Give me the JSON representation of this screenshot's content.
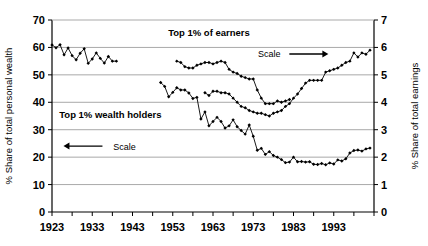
{
  "chart_data": {
    "type": "line",
    "title": "",
    "subtitle": "",
    "xlabel": "",
    "ylabel": "% Share of total personal wealth",
    "y2label": "% Share of total earnings",
    "xlim": [
      1923,
      2003
    ],
    "ylim": [
      0,
      70
    ],
    "y2lim": [
      0,
      7
    ],
    "xticks": [
      1923,
      1933,
      1943,
      1953,
      1963,
      1973,
      1983,
      1993
    ],
    "xtick_labels": [
      "1923",
      "1933",
      "1943",
      "1953",
      "1963",
      "1973",
      "1983",
      "1993"
    ],
    "xminor_step": 5,
    "yticks": [
      0,
      10,
      20,
      30,
      40,
      50,
      60,
      70
    ],
    "ytick_labels": [
      "0",
      "10",
      "20",
      "30",
      "40",
      "50",
      "60",
      "70"
    ],
    "y2ticks": [
      0,
      1,
      2,
      3,
      4,
      5,
      6,
      7
    ],
    "y2tick_labels": [
      "0",
      "1",
      "2",
      "3",
      "4",
      "5",
      "6",
      "7"
    ],
    "grid": "horizontal",
    "legend_position": "inline-annotations",
    "annotations": [
      {
        "name": "earners-label",
        "text": "Top 1% of earners",
        "x": 1962.0,
        "y_frac": 0.915
      },
      {
        "name": "earners-scale",
        "text": "Scale",
        "x": 1977.0,
        "y_frac": 0.805,
        "arrow": "right"
      },
      {
        "name": "wealth-label",
        "text": "Top 1% wealth holders",
        "x": 1937.5,
        "y_frac": 0.49
      },
      {
        "name": "wealth-scale",
        "text": "Scale",
        "x": 1941.0,
        "y_frac": 0.325,
        "arrow": "left"
      }
    ],
    "series": [
      {
        "name": "Top 1% wealth holders",
        "axis": "left",
        "marker": "diamond",
        "color": "#000000",
        "points": [
          [
            1923,
            60.9
          ],
          [
            1924,
            59.9
          ],
          [
            1925,
            61.0
          ],
          [
            1926,
            57.3
          ],
          [
            1927,
            59.8
          ],
          [
            1928,
            57.0
          ],
          [
            1929,
            55.5
          ],
          [
            1930,
            57.9
          ],
          [
            1931,
            59.5
          ],
          [
            1932,
            54.2
          ],
          [
            1933,
            55.8
          ],
          [
            1934,
            58.0
          ],
          [
            1935,
            56.0
          ],
          [
            1936,
            54.3
          ],
          [
            1937,
            56.7
          ],
          [
            1938,
            55.0
          ],
          [
            1939,
            55.0
          ],
          [
            1950,
            47.2
          ],
          [
            1951,
            45.8
          ],
          [
            1952,
            42.0
          ],
          [
            1953,
            43.6
          ],
          [
            1954,
            45.3
          ],
          [
            1955,
            44.5
          ],
          [
            1956,
            44.5
          ],
          [
            1957,
            43.4
          ],
          [
            1958,
            41.4
          ],
          [
            1959,
            41.8
          ],
          [
            1960,
            33.9
          ],
          [
            1961,
            36.5
          ],
          [
            1962,
            31.4
          ],
          [
            1963,
            33.0
          ],
          [
            1964,
            34.5
          ],
          [
            1965,
            33.0
          ],
          [
            1966,
            30.6
          ],
          [
            1967,
            31.4
          ],
          [
            1968,
            33.6
          ],
          [
            1969,
            31.1
          ],
          [
            1970,
            29.7
          ],
          [
            1971,
            28.4
          ],
          [
            1972,
            31.7
          ],
          [
            1973,
            27.6
          ],
          [
            1974,
            22.5
          ],
          [
            1975,
            23.2
          ],
          [
            1976,
            21.0
          ],
          [
            1977,
            22.0
          ],
          [
            1978,
            20.6
          ],
          [
            1979,
            20.0
          ],
          [
            1980,
            19.1
          ],
          [
            1981,
            18.0
          ],
          [
            1982,
            18.2
          ],
          [
            1983,
            20.0
          ],
          [
            1984,
            18.3
          ],
          [
            1985,
            18.4
          ],
          [
            1986,
            18.2
          ],
          [
            1987,
            18.3
          ],
          [
            1988,
            17.4
          ],
          [
            1989,
            17.3
          ],
          [
            1990,
            17.7
          ],
          [
            1991,
            17.2
          ],
          [
            1992,
            17.9
          ],
          [
            1993,
            17.5
          ],
          [
            1994,
            19.0
          ],
          [
            1995,
            18.6
          ],
          [
            1996,
            19.4
          ],
          [
            1997,
            21.5
          ],
          [
            1998,
            22.4
          ],
          [
            1999,
            22.6
          ],
          [
            2000,
            22.2
          ],
          [
            2001,
            23.0
          ],
          [
            2002,
            23.3
          ]
        ]
      },
      {
        "name": "Top 1% of earners",
        "axis": "right",
        "marker": "diamond",
        "color": "#000000",
        "points": [
          [
            1954,
            5.5
          ],
          [
            1955,
            5.45
          ],
          [
            1956,
            5.3
          ],
          [
            1957,
            5.25
          ],
          [
            1958,
            5.25
          ],
          [
            1959,
            5.35
          ],
          [
            1960,
            5.4
          ],
          [
            1961,
            5.45
          ],
          [
            1962,
            5.45
          ],
          [
            1963,
            5.4
          ],
          [
            1964,
            5.45
          ],
          [
            1965,
            5.5
          ],
          [
            1966,
            5.45
          ],
          [
            1967,
            5.2
          ],
          [
            1968,
            5.1
          ],
          [
            1969,
            5.05
          ],
          [
            1970,
            4.95
          ],
          [
            1971,
            4.9
          ],
          [
            1972,
            4.85
          ],
          [
            1973,
            4.85
          ],
          [
            1974,
            4.45
          ],
          [
            1975,
            4.15
          ],
          [
            1976,
            3.95
          ],
          [
            1977,
            3.95
          ],
          [
            1978,
            3.95
          ],
          [
            1979,
            4.05
          ],
          [
            1980,
            4.0
          ],
          [
            1981,
            4.05
          ],
          [
            1982,
            4.1
          ],
          [
            1961,
            4.35
          ],
          [
            1962,
            4.25
          ],
          [
            1963,
            4.4
          ],
          [
            1964,
            4.4
          ],
          [
            1965,
            4.35
          ],
          [
            1966,
            4.35
          ],
          [
            1967,
            4.3
          ],
          [
            1968,
            4.15
          ],
          [
            1969,
            4.0
          ],
          [
            1970,
            3.85
          ],
          [
            1971,
            3.8
          ],
          [
            1972,
            3.7
          ],
          [
            1973,
            3.65
          ],
          [
            1974,
            3.6
          ],
          [
            1975,
            3.6
          ],
          [
            1976,
            3.55
          ],
          [
            1977,
            3.5
          ],
          [
            1978,
            3.6
          ],
          [
            1979,
            3.65
          ],
          [
            1980,
            3.7
          ],
          [
            1981,
            3.85
          ],
          [
            1982,
            3.95
          ],
          [
            1983,
            4.15
          ],
          [
            1984,
            4.3
          ],
          [
            1985,
            4.5
          ],
          [
            1986,
            4.7
          ],
          [
            1987,
            4.8
          ],
          [
            1988,
            4.8
          ],
          [
            1989,
            4.8
          ],
          [
            1990,
            4.8
          ],
          [
            1991,
            5.1
          ],
          [
            1992,
            5.15
          ],
          [
            1993,
            5.2
          ],
          [
            1994,
            5.25
          ],
          [
            1995,
            5.35
          ],
          [
            1996,
            5.45
          ],
          [
            1997,
            5.5
          ],
          [
            1998,
            5.8
          ],
          [
            1999,
            5.65
          ],
          [
            2000,
            5.8
          ],
          [
            2001,
            5.75
          ],
          [
            2002,
            5.9
          ]
        ]
      }
    ]
  },
  "axes": {
    "left_title": "% Share of total personal wealth",
    "right_title": "% Share of total earnings"
  },
  "labels": {
    "earners": "Top 1% of earners",
    "wealth_holders": "Top 1% wealth holders",
    "scale_right": "Scale",
    "scale_left": "Scale"
  }
}
